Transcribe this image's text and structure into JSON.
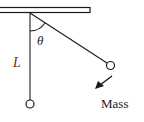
{
  "diagram": {
    "labels": {
      "length": "L",
      "angle": "θ",
      "mass": "Mass"
    },
    "colors": {
      "stroke": "#1a1a1a",
      "length_label": "#7a2a2a",
      "background": "#ffffff"
    }
  }
}
